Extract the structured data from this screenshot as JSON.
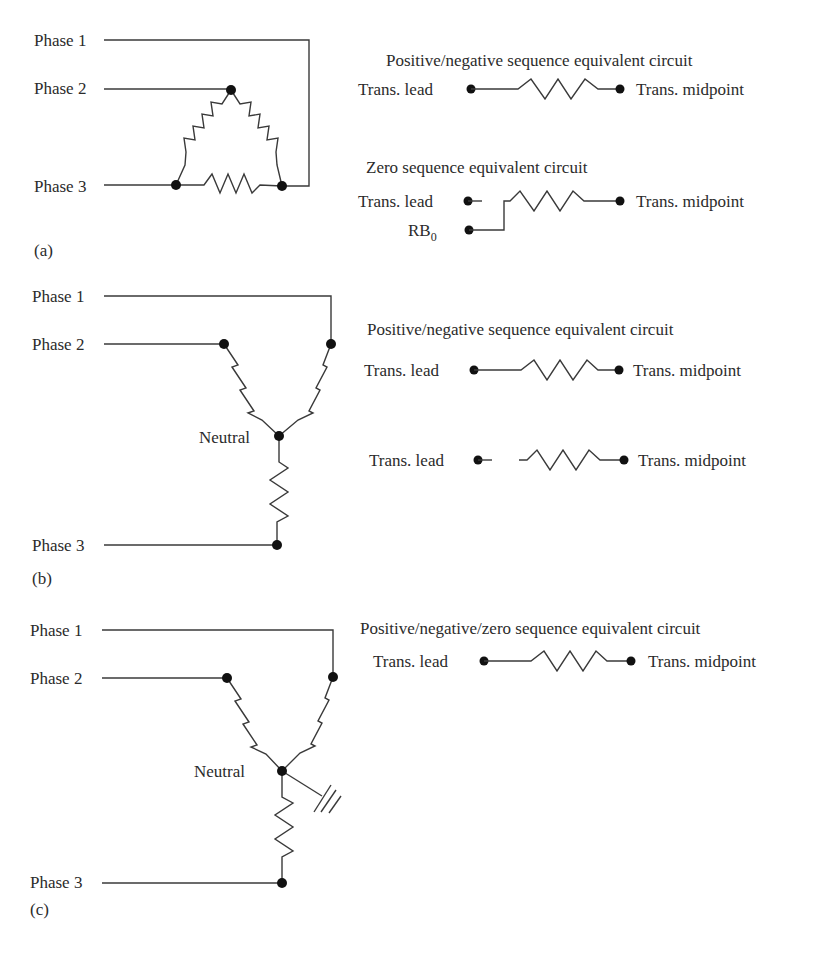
{
  "panels": [
    {
      "id": "a",
      "panel_label": "(a)",
      "connection": "delta",
      "phase_labels": [
        "Phase 1",
        "Phase 2",
        "Phase 3"
      ],
      "equivalent_circuits": [
        {
          "title": "Positive/negative sequence equivalent circuit",
          "left_label": "Trans. lead",
          "right_label": "Trans. midpoint",
          "connected": true
        },
        {
          "title": "Zero sequence equivalent circuit",
          "left_label": "Trans. lead",
          "right_label": "Trans. midpoint",
          "connected": false,
          "reference_bus": {
            "base": "RB",
            "subscript": "0"
          }
        }
      ]
    },
    {
      "id": "b",
      "panel_label": "(b)",
      "connection": "ungrounded wye",
      "phase_labels": [
        "Phase 1",
        "Phase 2",
        "Phase 3"
      ],
      "neutral_label": "Neutral",
      "equivalent_circuits": [
        {
          "title": "Positive/negative sequence equivalent circuit",
          "left_label": "Trans. lead",
          "right_label": "Trans. midpoint",
          "connected": true
        },
        {
          "title": "",
          "left_label": "Trans. lead",
          "right_label": "Trans. midpoint",
          "connected": false
        }
      ]
    },
    {
      "id": "c",
      "panel_label": "(c)",
      "connection": "grounded wye",
      "phase_labels": [
        "Phase 1",
        "Phase 2",
        "Phase 3"
      ],
      "neutral_label": "Neutral",
      "equivalent_circuits": [
        {
          "title": "Positive/negative/zero sequence equivalent circuit",
          "left_label": "Trans. lead",
          "right_label": "Trans. midpoint",
          "connected": true
        }
      ]
    }
  ]
}
